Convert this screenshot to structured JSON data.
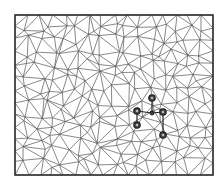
{
  "diagram": {
    "title": "",
    "type": "triangular-mesh",
    "frame": {
      "x": 15,
      "y": 15,
      "width": 198,
      "height": 160
    },
    "colors": {
      "edge": "#555555",
      "frame": "#333333",
      "highlight": "#444444"
    },
    "highlighted_nodes": [
      {
        "x": 152,
        "y": 98,
        "r": 3.2
      },
      {
        "x": 137,
        "y": 111,
        "r": 3.2
      },
      {
        "x": 152,
        "y": 113,
        "r": 1.8
      },
      {
        "x": 163,
        "y": 112,
        "r": 3.2
      },
      {
        "x": 137,
        "y": 125,
        "r": 3.2
      },
      {
        "x": 163,
        "y": 135,
        "r": 3.2
      }
    ],
    "highlighted_edges": [
      [
        0,
        2
      ],
      [
        1,
        2
      ],
      [
        2,
        3
      ],
      [
        3,
        5
      ],
      [
        1,
        4
      ]
    ]
  }
}
